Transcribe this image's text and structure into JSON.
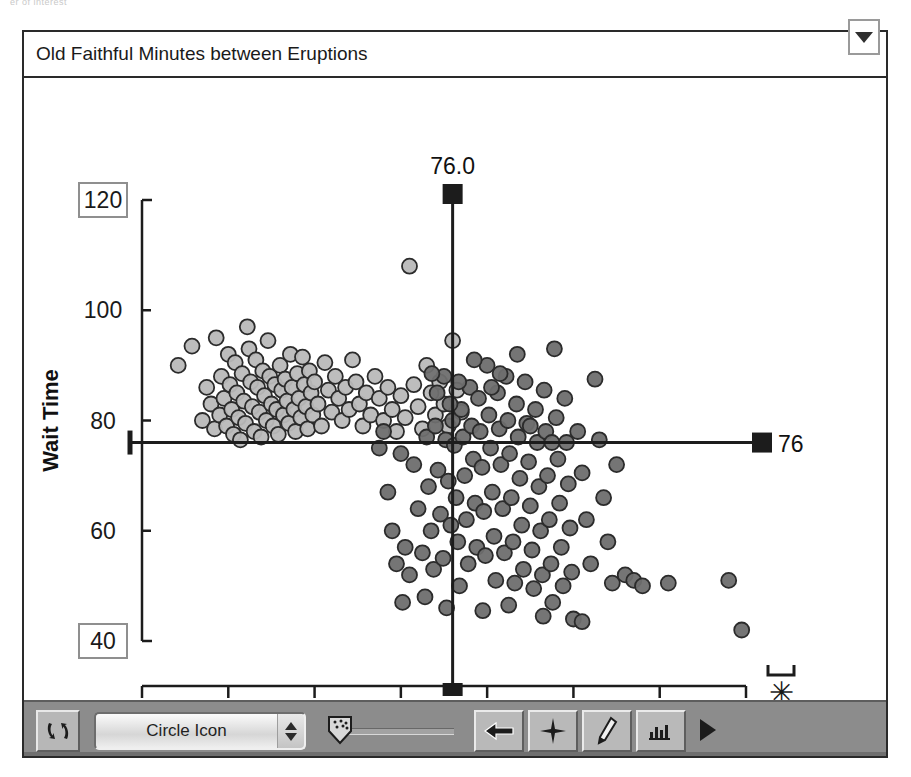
{
  "top_sliver_text": "er of interest",
  "window": {
    "title": "Old Faithful Minutes between Eruptions",
    "disclosure_icon": "triangle-down-icon"
  },
  "toolbar": {
    "refresh_icon": "refresh-cycle-icon",
    "shape_select_value": "Circle Icon",
    "stepper_up_icon": "triangle-up-icon",
    "stepper_down_icon": "triangle-down-icon",
    "slider_name": "point-density-slider",
    "slider_thumb_icon": "dotted-shield-icon",
    "slider_value_pct": 8,
    "tools": [
      {
        "name": "arrow-select-tool",
        "icon": "left-arrow-icon"
      },
      {
        "name": "brush-tool",
        "icon": "crosshair-star-icon"
      },
      {
        "name": "pencil-tool",
        "icon": "pencil-icon"
      },
      {
        "name": "histogram-tool",
        "icon": "ruler-histogram-icon"
      }
    ],
    "play_icon": "play-triangle-icon"
  },
  "chart_data": {
    "type": "scatter",
    "title": "Old Faithful Minutes between Eruptions",
    "xlabel": "PrevTime",
    "ylabel": "Wait Time",
    "xlim": [
      40,
      110
    ],
    "ylim": [
      40,
      120
    ],
    "xticks": [
      40,
      50,
      60,
      70,
      80,
      90,
      100,
      110
    ],
    "yticks": [
      40,
      60,
      80,
      100,
      120
    ],
    "boxed_xticks": [
      40,
      110
    ],
    "boxed_yticks": [
      40,
      120
    ],
    "grid": false,
    "legend": "none",
    "marker": "circle",
    "crosshair": {
      "x_value": 76.0,
      "y_value": 76,
      "x_label": "76.0",
      "y_label": "76"
    },
    "outlier_marker": {
      "name": "outlier-asterisk",
      "glyph": "✳",
      "bracket": true
    },
    "series": [
      {
        "name": "short-eruption-cluster",
        "color": "#b9b9b9",
        "points": [
          [
            44.2,
            90.0
          ],
          [
            45.8,
            93.5
          ],
          [
            47.0,
            80.0
          ],
          [
            47.5,
            86.0
          ],
          [
            48.0,
            83.0
          ],
          [
            48.4,
            78.5
          ],
          [
            48.6,
            95.0
          ],
          [
            49.0,
            81.0
          ],
          [
            49.2,
            88.0
          ],
          [
            49.5,
            84.0
          ],
          [
            49.8,
            79.0
          ],
          [
            50.0,
            92.0
          ],
          [
            50.2,
            86.5
          ],
          [
            50.4,
            82.0
          ],
          [
            50.6,
            77.5
          ],
          [
            50.8,
            90.5
          ],
          [
            51.0,
            85.0
          ],
          [
            51.2,
            80.5
          ],
          [
            51.4,
            76.5
          ],
          [
            51.6,
            88.5
          ],
          [
            51.8,
            83.5
          ],
          [
            52.0,
            79.5
          ],
          [
            52.2,
            97.0
          ],
          [
            52.4,
            93.0
          ],
          [
            52.6,
            87.0
          ],
          [
            52.8,
            82.5
          ],
          [
            53.0,
            78.0
          ],
          [
            53.2,
            91.0
          ],
          [
            53.4,
            86.0
          ],
          [
            53.6,
            81.5
          ],
          [
            53.8,
            77.0
          ],
          [
            54.0,
            89.0
          ],
          [
            54.2,
            84.5
          ],
          [
            54.4,
            80.0
          ],
          [
            54.6,
            94.5
          ],
          [
            54.8,
            88.0
          ],
          [
            55.0,
            83.0
          ],
          [
            55.2,
            79.0
          ],
          [
            55.4,
            86.5
          ],
          [
            55.6,
            82.0
          ],
          [
            55.8,
            77.5
          ],
          [
            56.0,
            90.0
          ],
          [
            56.2,
            85.5
          ],
          [
            56.4,
            81.0
          ],
          [
            56.6,
            87.5
          ],
          [
            56.8,
            83.5
          ],
          [
            57.0,
            79.5
          ],
          [
            57.2,
            92.0
          ],
          [
            57.4,
            86.0
          ],
          [
            57.6,
            82.0
          ],
          [
            57.8,
            78.0
          ],
          [
            58.0,
            88.5
          ],
          [
            58.2,
            84.0
          ],
          [
            58.4,
            80.5
          ],
          [
            58.6,
            91.5
          ],
          [
            58.8,
            86.5
          ],
          [
            59.0,
            82.5
          ],
          [
            59.2,
            78.5
          ],
          [
            59.4,
            89.0
          ],
          [
            59.6,
            85.0
          ],
          [
            59.8,
            81.0
          ],
          [
            60.0,
            87.0
          ],
          [
            60.4,
            83.0
          ],
          [
            60.8,
            79.0
          ],
          [
            61.2,
            90.5
          ],
          [
            61.6,
            85.5
          ],
          [
            62.0,
            81.5
          ],
          [
            62.4,
            88.0
          ],
          [
            62.8,
            84.0
          ],
          [
            63.2,
            80.0
          ],
          [
            63.6,
            86.0
          ],
          [
            64.0,
            82.0
          ],
          [
            64.4,
            91.0
          ],
          [
            64.8,
            87.0
          ],
          [
            65.2,
            83.0
          ],
          [
            65.6,
            79.0
          ],
          [
            66.0,
            85.0
          ],
          [
            66.5,
            81.0
          ],
          [
            67.0,
            88.0
          ],
          [
            67.5,
            84.0
          ],
          [
            68.0,
            80.0
          ],
          [
            68.5,
            86.0
          ],
          [
            69.0,
            82.0
          ],
          [
            69.5,
            78.0
          ],
          [
            70.0,
            84.5
          ],
          [
            70.5,
            80.5
          ],
          [
            71.0,
            108.0
          ],
          [
            71.5,
            86.5
          ],
          [
            72.0,
            82.5
          ],
          [
            72.5,
            78.5
          ],
          [
            73.0,
            90.0
          ],
          [
            73.5,
            85.0
          ],
          [
            74.0,
            81.0
          ],
          [
            74.5,
            87.0
          ],
          [
            75.0,
            83.0
          ],
          [
            75.5,
            79.0
          ],
          [
            76.0,
            94.5
          ],
          [
            76.5,
            85.5
          ],
          [
            77.0,
            81.5
          ]
        ]
      },
      {
        "name": "long-eruption-cluster",
        "color": "#6e6e6e",
        "points": [
          [
            68.0,
            78.0
          ],
          [
            69.0,
            60.0
          ],
          [
            69.5,
            54.0
          ],
          [
            70.0,
            74.0
          ],
          [
            70.5,
            57.0
          ],
          [
            71.0,
            52.0
          ],
          [
            71.5,
            72.0
          ],
          [
            72.0,
            64.0
          ],
          [
            72.5,
            56.0
          ],
          [
            73.0,
            77.0
          ],
          [
            73.2,
            68.0
          ],
          [
            73.5,
            60.0
          ],
          [
            73.8,
            53.0
          ],
          [
            74.0,
            79.0
          ],
          [
            74.3,
            71.0
          ],
          [
            74.6,
            63.0
          ],
          [
            74.9,
            55.0
          ],
          [
            75.0,
            88.0
          ],
          [
            75.2,
            76.5
          ],
          [
            75.5,
            69.0
          ],
          [
            75.8,
            61.0
          ],
          [
            76.0,
            80.0
          ],
          [
            76.2,
            75.5
          ],
          [
            76.4,
            66.0
          ],
          [
            76.6,
            58.0
          ],
          [
            76.8,
            50.0
          ],
          [
            77.0,
            82.0
          ],
          [
            77.2,
            77.0
          ],
          [
            77.4,
            70.0
          ],
          [
            77.6,
            62.0
          ],
          [
            77.8,
            54.0
          ],
          [
            78.0,
            86.0
          ],
          [
            78.2,
            79.0
          ],
          [
            78.4,
            73.0
          ],
          [
            78.6,
            65.0
          ],
          [
            78.8,
            57.0
          ],
          [
            79.0,
            84.0
          ],
          [
            79.2,
            78.0
          ],
          [
            79.4,
            71.5
          ],
          [
            79.6,
            63.5
          ],
          [
            79.8,
            55.5
          ],
          [
            80.0,
            90.0
          ],
          [
            80.2,
            81.0
          ],
          [
            80.4,
            75.0
          ],
          [
            80.6,
            67.0
          ],
          [
            80.8,
            59.0
          ],
          [
            81.0,
            51.0
          ],
          [
            81.2,
            85.0
          ],
          [
            81.4,
            78.5
          ],
          [
            81.6,
            72.0
          ],
          [
            81.8,
            64.0
          ],
          [
            82.0,
            56.0
          ],
          [
            82.2,
            88.0
          ],
          [
            82.4,
            80.0
          ],
          [
            82.6,
            74.0
          ],
          [
            82.8,
            66.0
          ],
          [
            83.0,
            58.0
          ],
          [
            83.2,
            50.5
          ],
          [
            83.4,
            83.0
          ],
          [
            83.6,
            77.0
          ],
          [
            83.8,
            69.5
          ],
          [
            84.0,
            61.0
          ],
          [
            84.2,
            53.0
          ],
          [
            84.4,
            87.0
          ],
          [
            84.6,
            79.5
          ],
          [
            84.8,
            72.5
          ],
          [
            85.0,
            64.5
          ],
          [
            85.2,
            56.5
          ],
          [
            85.4,
            49.5
          ],
          [
            85.6,
            82.0
          ],
          [
            85.8,
            76.0
          ],
          [
            86.0,
            68.0
          ],
          [
            86.2,
            60.0
          ],
          [
            86.4,
            52.0
          ],
          [
            86.6,
            85.5
          ],
          [
            86.8,
            78.0
          ],
          [
            87.0,
            70.0
          ],
          [
            87.2,
            62.0
          ],
          [
            87.4,
            54.0
          ],
          [
            87.6,
            47.0
          ],
          [
            87.8,
            93.0
          ],
          [
            88.0,
            80.5
          ],
          [
            88.2,
            73.0
          ],
          [
            88.4,
            65.0
          ],
          [
            88.6,
            57.0
          ],
          [
            88.8,
            50.0
          ],
          [
            89.0,
            84.0
          ],
          [
            89.2,
            76.0
          ],
          [
            89.4,
            68.5
          ],
          [
            89.6,
            60.5
          ],
          [
            89.8,
            52.5
          ],
          [
            90.0,
            44.0
          ],
          [
            90.5,
            78.0
          ],
          [
            91.0,
            70.5
          ],
          [
            91.5,
            62.0
          ],
          [
            92.0,
            54.0
          ],
          [
            92.5,
            87.5
          ],
          [
            93.0,
            76.5
          ],
          [
            93.5,
            66.0
          ],
          [
            94.0,
            58.0
          ],
          [
            94.5,
            50.5
          ],
          [
            95.0,
            72.0
          ],
          [
            96.0,
            52.0
          ],
          [
            97.0,
            51.0
          ],
          [
            98.0,
            50.0
          ],
          [
            101.0,
            50.5
          ],
          [
            108.0,
            51.0
          ],
          [
            109.5,
            42.0
          ],
          [
            67.5,
            75.0
          ],
          [
            68.5,
            67.0
          ],
          [
            70.2,
            47.0
          ],
          [
            72.8,
            48.0
          ],
          [
            75.3,
            46.0
          ],
          [
            79.5,
            45.5
          ],
          [
            82.5,
            46.5
          ],
          [
            86.5,
            44.5
          ],
          [
            91.0,
            43.5
          ],
          [
            74.2,
            85.0
          ],
          [
            75.7,
            83.0
          ],
          [
            78.5,
            91.0
          ],
          [
            80.5,
            86.0
          ],
          [
            83.5,
            92.0
          ],
          [
            73.6,
            88.5
          ],
          [
            76.7,
            87.0
          ],
          [
            81.5,
            88.5
          ],
          [
            85.0,
            79.0
          ],
          [
            87.5,
            76.0
          ]
        ]
      }
    ]
  }
}
